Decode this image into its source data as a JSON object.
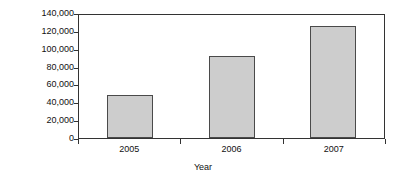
{
  "chart_data": {
    "type": "bar",
    "title": "",
    "xlabel": "Year",
    "ylabel": "Volume",
    "categories": [
      "2005",
      "2006",
      "2007"
    ],
    "values": [
      48000,
      92000,
      125000
    ],
    "ylim": [
      0,
      140000
    ],
    "yticks": [
      0,
      20000,
      40000,
      60000,
      80000,
      100000,
      120000,
      140000
    ],
    "ytick_labels": [
      "0",
      "20,000",
      "40,000",
      "60,000",
      "80,000",
      "100,000",
      "120,000",
      "140,000"
    ],
    "grid": false,
    "legend": null,
    "bar_fill_color": "#cdcdcd",
    "bar_edge_color": "#4a4a4a",
    "axis_color": "#333333",
    "background_color": "#ffffff"
  }
}
